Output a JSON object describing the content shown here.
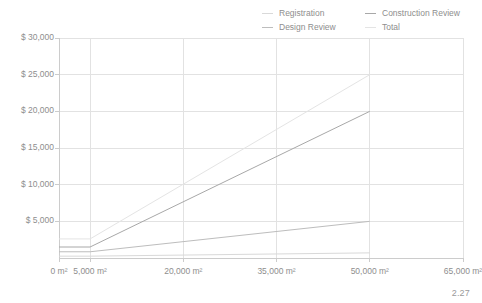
{
  "chart_data": {
    "type": "line",
    "title": "",
    "subtitle": "",
    "xlabel": "",
    "ylabel": "",
    "grid": true,
    "legend_position": "top-right",
    "x": [
      0,
      5000,
      50000
    ],
    "xlim": [
      0,
      65000
    ],
    "ylim": [
      0,
      30000
    ],
    "x_tick_values": [
      0,
      5000,
      20000,
      35000,
      50000,
      65000
    ],
    "x_tick_labels": [
      "0 m²",
      "5,000 m²",
      "20,000 m²",
      "35,000 m²",
      "50,000 m²",
      "65,000 m²"
    ],
    "y_tick_values": [
      5000,
      10000,
      15000,
      20000,
      25000,
      30000
    ],
    "y_tick_labels": [
      "$ 5,000",
      "$ 10,000",
      "$ 15,000",
      "$ 20,000",
      "$ 25,000",
      "$ 30,000"
    ],
    "series": [
      {
        "name": "Registration",
        "color": "#d9d9d9",
        "values": [
          250,
          250,
          700
        ]
      },
      {
        "name": "Design Review",
        "color": "#bdbdbd",
        "values": [
          850,
          850,
          5000
        ]
      },
      {
        "name": "Construction Review",
        "color": "#a8a8a8",
        "values": [
          1500,
          1500,
          20000
        ]
      },
      {
        "name": "Total",
        "color": "#e4e4e4",
        "values": [
          2600,
          2600,
          25000
        ]
      }
    ]
  },
  "legend": {
    "entries": [
      {
        "label": "Registration",
        "color": "#d9d9d9"
      },
      {
        "label": "Construction Review",
        "color": "#a8a8a8"
      },
      {
        "label": "Design Review",
        "color": "#bdbdbd"
      },
      {
        "label": "Total",
        "color": "#e4e4e4"
      }
    ]
  },
  "footer": {
    "note": "2.27"
  },
  "theme": {
    "grid_color": "#e2e2e2",
    "axis_color": "#cccccc",
    "text_color": "#8e8e8e",
    "background": "#ffffff"
  }
}
